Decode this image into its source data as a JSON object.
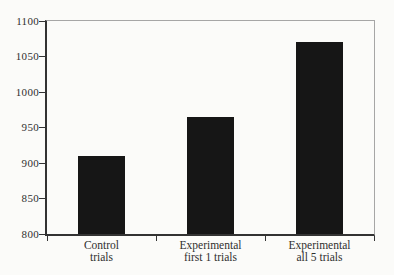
{
  "chart_data": {
    "type": "bar",
    "title": "",
    "xlabel": "",
    "ylabel": "",
    "categories": [
      {
        "id": "control-trials",
        "line1": "Control",
        "line2": "trials"
      },
      {
        "id": "experimental-first-1-trials",
        "line1": "Experimental",
        "line2": "first 1 trials"
      },
      {
        "id": "experimental-all-5-trials",
        "line1": "Experimental",
        "line2": "all 5 trials"
      }
    ],
    "values": [
      910,
      965,
      1070
    ],
    "ylim": [
      800,
      1100
    ],
    "yticks": [
      800,
      850,
      900,
      950,
      1000,
      1050,
      1100
    ],
    "grid": false,
    "legend": null,
    "colors": {
      "bar": "#161616",
      "axis": "#333333",
      "frame": "#a6a6a6",
      "text": "#2f2f2f",
      "background": "#fbfbf9"
    }
  }
}
